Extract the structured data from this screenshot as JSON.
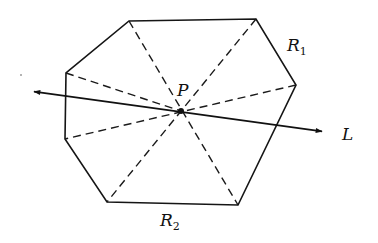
{
  "diagram": {
    "type": "geometry",
    "labels": {
      "point": "P",
      "line": "L",
      "region1": {
        "main": "R",
        "sub": "1"
      },
      "region2": {
        "main": "R",
        "sub": "2"
      }
    },
    "polygon_vertices": [
      [
        129,
        21
      ],
      [
        256,
        19
      ],
      [
        296,
        85
      ],
      [
        238,
        205
      ],
      [
        107,
        202
      ],
      [
        65,
        139
      ],
      [
        66,
        73
      ]
    ],
    "point_P": [
      181,
      111
    ],
    "line_L": {
      "start": [
        30,
        91
      ],
      "end": [
        326,
        132
      ],
      "arrows": "both"
    },
    "dashed_segments_from_P": [
      [
        129,
        21
      ],
      [
        256,
        19
      ],
      [
        296,
        85
      ],
      [
        238,
        205
      ],
      [
        107,
        202
      ],
      [
        65,
        139
      ],
      [
        66,
        73
      ]
    ],
    "colors": {
      "stroke": "#151515",
      "background": "#ffffff"
    }
  }
}
